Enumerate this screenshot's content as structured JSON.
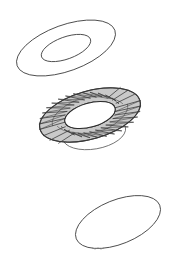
{
  "figure": {
    "background_color": "#ffffff",
    "width": 178,
    "height": 265,
    "outline_color": "#3a3a3a",
    "mesh_fill_color": "#c9c9c9",
    "mesh_line_color": "#2b2b2b"
  },
  "shapes": [
    {
      "id": "top-annulus",
      "name": "wireframe-annulus",
      "description": "Outline annulus: two concentric tilted ellipses, no fill",
      "style": "outline",
      "center_x": 66,
      "center_y": 48,
      "outer_rx": 52,
      "outer_ry": 23,
      "inner_rx": 26,
      "inner_ry": 11,
      "rotation_deg": -20
    },
    {
      "id": "middle-annulus-mesh",
      "name": "triangulated-mesh-annulus",
      "description": "Annulus filled with irregular triangular mesh, gray shading",
      "style": "mesh",
      "center_x": 90,
      "center_y": 115,
      "outer_rx": 52,
      "outer_ry": 24,
      "inner_rx": 26,
      "inner_ry": 12,
      "rotation_deg": -16,
      "triangle_count": 84
    },
    {
      "id": "hidden-ellipse",
      "name": "occluded-ellipse",
      "description": "Ellipse outline partly hidden behind the mesh annulus",
      "style": "outline",
      "center_x": 94,
      "center_y": 133,
      "rx": 32,
      "ry": 16,
      "rotation_deg": -10
    },
    {
      "id": "bottom-ellipse",
      "name": "plain-ellipse",
      "description": "Single tilted ellipse outline, no fill",
      "style": "outline",
      "center_x": 118,
      "center_y": 222,
      "rx": 45,
      "ry": 22,
      "rotation_deg": -22
    }
  ],
  "labels": {
    "top": "",
    "middle": "",
    "bottom": ""
  }
}
